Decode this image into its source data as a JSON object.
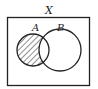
{
  "diagram": {
    "type": "venn",
    "universe_label": "X",
    "sets": [
      {
        "id": "A",
        "label": "A"
      },
      {
        "id": "B",
        "label": "B"
      }
    ],
    "shaded_region": "A \\ B",
    "shading_style": "diagonal-hatch",
    "colors": {
      "stroke": "#222222",
      "background": "#ffffff"
    }
  }
}
